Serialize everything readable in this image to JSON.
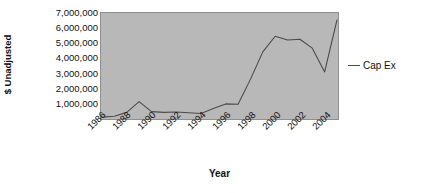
{
  "chart_data": {
    "type": "line",
    "title": "",
    "xlabel": "Year",
    "ylabel": "$ Unadjusted",
    "x": [
      1986,
      1987,
      1988,
      1989,
      1990,
      1991,
      1992,
      1993,
      1994,
      1995,
      1996,
      1997,
      1998,
      1999,
      2000,
      2001,
      2002,
      2003,
      2004,
      2005
    ],
    "series": [
      {
        "name": "Cap Ex",
        "color": "#4b4b4b",
        "values": [
          60000,
          120000,
          380000,
          1100000,
          430000,
          380000,
          400000,
          360000,
          300000,
          640000,
          950000,
          930000,
          2600000,
          4450000,
          5500000,
          5250000,
          5300000,
          4700000,
          3100000,
          6600000
        ]
      }
    ],
    "xlim": [
      1986,
      2005
    ],
    "ylim": [
      0,
      7000000
    ],
    "xtick_labels": [
      "1986",
      "1988",
      "1990",
      "1992",
      "1994",
      "1996",
      "1998",
      "2000",
      "2002",
      "2004"
    ],
    "xtick_values": [
      1986,
      1988,
      1990,
      1992,
      1994,
      1996,
      1998,
      2000,
      2002,
      2004
    ],
    "ytick_labels": [
      "7,000,000",
      "6,000,000",
      "5,000,000",
      "4,000,000",
      "3,000,000",
      "2,000,000",
      "1,000,000",
      "-"
    ],
    "ytick_values": [
      7000000,
      6000000,
      5000000,
      4000000,
      3000000,
      2000000,
      1000000,
      0
    ],
    "grid": false,
    "legend_position": "right",
    "plot_background": "#b8b8b8"
  },
  "axes": {
    "y_title": "$ Unadjusted",
    "x_title": "Year"
  },
  "legend": {
    "entries": [
      {
        "label": "Cap Ex",
        "color": "#4b4b4b"
      }
    ]
  }
}
